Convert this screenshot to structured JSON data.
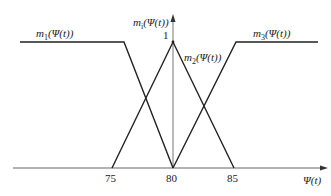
{
  "diagram": {
    "type": "fuzzy membership functions",
    "y_axis_label": "m_i(Ψ(t))",
    "x_axis_label": "Ψ(t)",
    "peak_value_label": "1",
    "x_ticks": [
      "75",
      "80",
      "85"
    ],
    "curves": [
      {
        "name": "m_1(Ψ(t))",
        "shape": "Z-shaped (left shoulder)",
        "plateau_until": 77.5,
        "zero_at": 80
      },
      {
        "name": "m_2(Ψ(t))",
        "shape": "triangular",
        "left_zero": 75,
        "peak": 80,
        "right_zero": 85
      },
      {
        "name": "m_3(Ψ(t))",
        "shape": "S-shaped (right shoulder)",
        "zero_until": 80,
        "plateau_from": 85
      }
    ]
  },
  "labels": {
    "m1": "m",
    "m1_sub": "1",
    "m1_arg": "(Ψ(t))",
    "m2": "m",
    "m2_sub": "2",
    "m2_arg": "(Ψ(t))",
    "m3": "m",
    "m3_sub": "3",
    "m3_arg": "(Ψ(t))",
    "mi": "m",
    "mi_sub": "i",
    "mi_arg": "(Ψ(t))",
    "one": "1",
    "xaxis": "Ψ(t)",
    "tick75": "75",
    "tick80": "80",
    "tick85": "85"
  },
  "colors": {
    "line": "#222222",
    "axis": "#555555"
  }
}
